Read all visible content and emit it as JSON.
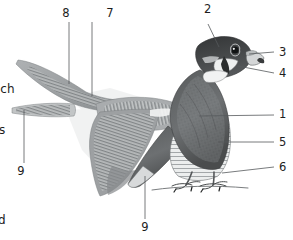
{
  "plate": {
    "subject": "peregrine-falcon",
    "width": 293,
    "height": 240,
    "background_color": "#ffffff",
    "ink_color": "#1d1d1d",
    "leader_line_color": "#55595c"
  },
  "figures": {
    "flying_bird": {
      "name": "falcon-in-flight-underside",
      "plumage_dark": "#7b7e80",
      "plumage_mid": "#9a9d9f",
      "plumage_light": "#c9cbcc",
      "beak_dark": "#1c1c1c"
    },
    "perched_bird": {
      "name": "falcon-perched-side",
      "mantle_dark": "#4d4f50",
      "mantle_mid": "#6f7274",
      "breast_light": "#eceeee",
      "hood_dark": "#3a3c3d",
      "ground_line_color": "#6b6e70"
    }
  },
  "callouts": [
    {
      "id": "1",
      "number": "1",
      "target": "perched-wing-mantle",
      "x": 279,
      "y": 115
    },
    {
      "id": "2",
      "number": "2",
      "target": "perched-crown-hood",
      "x": 204,
      "y": 10
    },
    {
      "id": "3",
      "number": "3",
      "target": "perched-beak-cere",
      "x": 279,
      "y": 53
    },
    {
      "id": "4",
      "number": "4",
      "target": "perched-malar-stripe",
      "x": 279,
      "y": 74
    },
    {
      "id": "5",
      "number": "5",
      "target": "perched-barred-underparts",
      "x": 279,
      "y": 143
    },
    {
      "id": "6",
      "number": "6",
      "target": "perched-tarsus-foot",
      "x": 279,
      "y": 168
    },
    {
      "id": "7",
      "number": "7",
      "target": "flight-inner-wing-coverts",
      "x": 110,
      "y": 14
    },
    {
      "id": "8",
      "number": "8",
      "target": "flight-outer-wing-primaries",
      "x": 66,
      "y": 14
    },
    {
      "id": "9",
      "number": "9",
      "target": "flight-tail",
      "x": 21,
      "y": 172
    },
    {
      "id": "9b",
      "number": "9",
      "target": "perched-tail",
      "x": 142,
      "y": 228
    }
  ],
  "edge_text": [
    {
      "id": "edge-1",
      "text": "ich",
      "x": -3,
      "y": 83
    },
    {
      "id": "edge-2",
      "text": "s",
      "x": -1,
      "y": 124
    },
    {
      "id": "edge-3",
      "text": "d",
      "x": -2,
      "y": 214
    }
  ]
}
